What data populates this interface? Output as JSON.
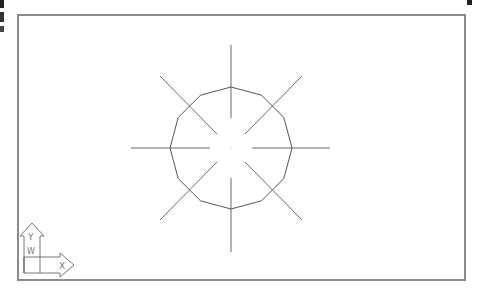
{
  "viewport": {
    "background": "#ffffff",
    "border_color": "#8a8a8a"
  },
  "drawing": {
    "center": [
      231,
      148
    ],
    "polygon": {
      "sides": 12,
      "radius": 61,
      "stroke": "#555555"
    },
    "crosshair_lines": {
      "stroke": "#666666"
    }
  },
  "ucs_icon": {
    "x_label": "X",
    "y_label": "Y",
    "w_label": "W"
  }
}
